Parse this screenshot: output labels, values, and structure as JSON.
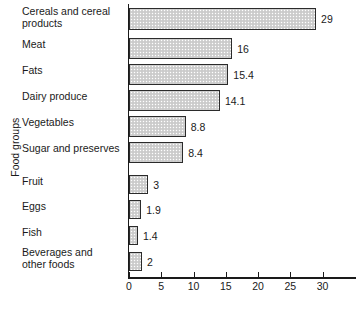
{
  "chart_data": {
    "type": "bar",
    "orientation": "horizontal",
    "title": "",
    "xlabel": "",
    "ylabel": "Food groups",
    "xlim": [
      0,
      33
    ],
    "xticks": [
      0,
      5,
      10,
      15,
      20,
      25,
      30
    ],
    "xtick_labels": [
      "0",
      "5",
      "10",
      "15",
      "20",
      "25",
      "30"
    ],
    "grid": false,
    "legend": null,
    "categories": [
      "Cereals and cereal products",
      "Meat",
      "Fats",
      "Dairy produce",
      "Vegetables",
      "Sugar and preserves",
      "Fruit",
      "Eggs",
      "Fish",
      "Beverages and other foods"
    ],
    "values": [
      29,
      16,
      15.4,
      14.1,
      8.8,
      8.4,
      3,
      1.9,
      1.4,
      2
    ],
    "value_labels": [
      "29",
      "16",
      "15.4",
      "14.1",
      "8.8",
      "8.4",
      "3",
      "1.9",
      "1.4",
      "2"
    ],
    "bar_fill_color": "#d2d2d2",
    "bar_border_color": "#2b2b2b",
    "axis_color": "#1a1a1a"
  },
  "labels": {
    "rows": [
      {
        "line1": "Cereals and cereal",
        "line2": "products"
      },
      {
        "line1": "Meat",
        "line2": ""
      },
      {
        "line1": "Fats",
        "line2": ""
      },
      {
        "line1": "Dairy produce",
        "line2": ""
      },
      {
        "line1": "Vegetables",
        "line2": ""
      },
      {
        "line1": "Sugar and preserves",
        "line2": ""
      },
      {
        "line1": "Fruit",
        "line2": ""
      },
      {
        "line1": "Eggs",
        "line2": ""
      },
      {
        "line1": "Fish",
        "line2": ""
      },
      {
        "line1": "Beverages and",
        "line2": "other foods"
      }
    ]
  },
  "axis": {
    "y_title": "Food groups",
    "x_title": ""
  }
}
